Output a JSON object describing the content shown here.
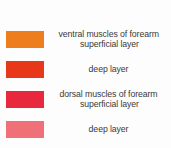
{
  "legend": {
    "title": "muscles of forearm legend",
    "background_color": "#fdfdfd",
    "text_color": "#3a3a3a",
    "entries": [
      {
        "swatch_color": "#ee7d1e",
        "swatch_name": "swatch-ventral-superficial",
        "line1": "ventral muscles of forearm",
        "line2": "superficial layer"
      },
      {
        "swatch_color": "#e8381a",
        "swatch_name": "swatch-ventral-deep",
        "line1": "deep layer",
        "line2": ""
      },
      {
        "swatch_color": "#e8283c",
        "swatch_name": "swatch-dorsal-superficial",
        "line1": "dorsal muscles of forearm",
        "line2": "superficial layer"
      },
      {
        "swatch_color": "#f07078",
        "swatch_name": "swatch-dorsal-deep",
        "line1": "deep layer",
        "line2": ""
      }
    ]
  }
}
